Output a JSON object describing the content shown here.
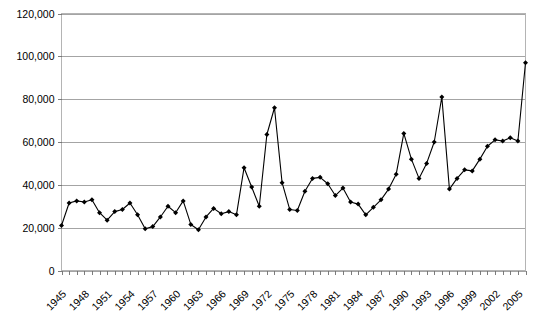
{
  "chart_data": {
    "type": "line",
    "title": "",
    "subtitle": "",
    "xlabel": "",
    "ylabel": "",
    "xlim": [
      1945,
      2006
    ],
    "ylim": [
      0,
      120000
    ],
    "ytick_values": [
      0,
      20000,
      40000,
      60000,
      80000,
      100000,
      120000
    ],
    "ytick_labels": [
      "0",
      "20,000",
      "40,000",
      "60,000",
      "80,000",
      "100,000",
      "120,000"
    ],
    "xtick_labels": [
      "1945",
      "1948",
      "1951",
      "1954",
      "1957",
      "1960",
      "1963",
      "1966",
      "1969",
      "1972",
      "1975",
      "1978",
      "1981",
      "1984",
      "1987",
      "1990",
      "1993",
      "1996",
      "1999",
      "2002",
      "2005"
    ],
    "xtick_step_years": 3,
    "grid": "horizontal",
    "legend": "none",
    "marker": "diamond",
    "line_color": "#000000",
    "marker_color": "#000000",
    "grid_color": "#9a9a9a",
    "background_color": "#ffffff",
    "x": [
      1945,
      1946,
      1947,
      1948,
      1949,
      1950,
      1951,
      1952,
      1953,
      1954,
      1955,
      1956,
      1957,
      1958,
      1959,
      1960,
      1961,
      1962,
      1963,
      1964,
      1965,
      1966,
      1967,
      1968,
      1969,
      1970,
      1971,
      1972,
      1973,
      1974,
      1975,
      1976,
      1977,
      1978,
      1979,
      1980,
      1981,
      1982,
      1983,
      1984,
      1985,
      1986,
      1987,
      1988,
      1989,
      1990,
      1991,
      1992,
      1993,
      1994,
      1995,
      1996,
      1997,
      1998,
      1999,
      2000,
      2001,
      2002,
      2003,
      2004,
      2005,
      2006
    ],
    "values": [
      21000,
      31500,
      32500,
      32000,
      33000,
      27000,
      23500,
      27500,
      28500,
      31500,
      26000,
      19500,
      20500,
      25000,
      30000,
      27000,
      32500,
      21500,
      19000,
      25000,
      29000,
      26500,
      27500,
      26000,
      48000,
      39000,
      30000,
      63500,
      76000,
      41000,
      28500,
      28000,
      37000,
      43000,
      43500,
      40500,
      35000,
      38500,
      32000,
      31000,
      26000,
      29500,
      33000,
      38000,
      45000,
      64000,
      52000,
      43000,
      50000,
      60000,
      81000,
      38000,
      43000,
      47000,
      46500,
      52000,
      58000,
      61000,
      60500,
      62000,
      60500,
      97000
    ],
    "series": [
      {
        "name": "series-1",
        "values": [
          21000,
          31500,
          32500,
          32000,
          33000,
          27000,
          23500,
          27500,
          28500,
          31500,
          26000,
          19500,
          20500,
          25000,
          30000,
          27000,
          32500,
          21500,
          19000,
          25000,
          29000,
          26500,
          27500,
          26000,
          48000,
          39000,
          30000,
          63500,
          76000,
          41000,
          28500,
          28000,
          37000,
          43000,
          43500,
          40500,
          35000,
          38500,
          32000,
          31000,
          26000,
          29500,
          33000,
          38000,
          45000,
          64000,
          52000,
          43000,
          50000,
          60000,
          81000,
          38000,
          43000,
          47000,
          46500,
          52000,
          58000,
          61000,
          60500,
          62000,
          60500,
          97000
        ]
      }
    ],
    "annotations": []
  }
}
